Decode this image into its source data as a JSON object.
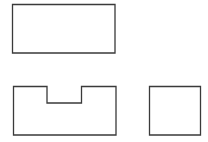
{
  "diagram": {
    "type": "orthographic-views",
    "stroke_color": "#3a3a3a",
    "background": "#ffffff",
    "views": [
      {
        "name": "top-view",
        "shape": "rectangle",
        "points": "12.5,4.5 115,4.5 115,53 12.5,53"
      },
      {
        "name": "front-view",
        "shape": "notched-rectangle",
        "points": "13.5,86.5 47,86.5 47,103 81.5,103 81.5,86.5 116,86.5 116,135 13.5,135"
      },
      {
        "name": "side-view",
        "shape": "square",
        "points": "149.5,86.5 200.5,86.5 200.5,135 149.5,135"
      }
    ]
  }
}
